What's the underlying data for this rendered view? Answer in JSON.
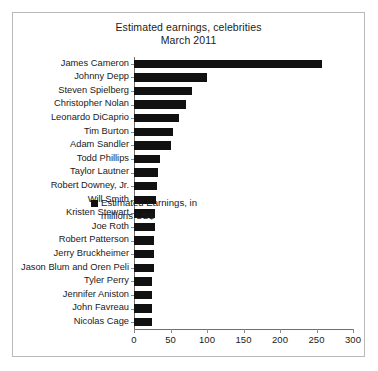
{
  "figure": {
    "title_line_1": "Estimated earnings, celebrities",
    "title_line_2": "March 2011",
    "border_color": "#b9b9b9",
    "background_color": "#ffffff",
    "bar_color": "#111111"
  },
  "legend": {
    "position": "inside-right",
    "entries": [
      {
        "label_line_1": "Estimated Earnings, in",
        "label_line_2": "millions US$",
        "color": "#111111"
      }
    ]
  },
  "chart_data": {
    "type": "bar",
    "orientation": "horizontal",
    "title": "Estimated earnings, celebrities\nMarch 2011",
    "xlabel": "",
    "ylabel": "",
    "xlim": [
      0,
      300
    ],
    "xticks": [
      0,
      50,
      100,
      150,
      200,
      250,
      300
    ],
    "xtick_labels": [
      "0",
      "50",
      "100",
      "150",
      "200",
      "250",
      "300"
    ],
    "grid": false,
    "legend_position": "center-right",
    "series": [
      {
        "name": "Estimated Earnings, in millions US$",
        "color": "#111111",
        "values": [
          257,
          100,
          80,
          71,
          62,
          53,
          50,
          35,
          33,
          32,
          30,
          29,
          29,
          28,
          28,
          27,
          25,
          25,
          24,
          24
        ]
      }
    ],
    "categories": [
      "James Cameron",
      "Johnny Depp",
      "Steven Spielberg",
      "Christopher Nolan",
      "Leonardo DiCaprio",
      "Tim Burton",
      "Adam Sandler",
      "Todd Phillips",
      "Taylor Lautner",
      "Robert Downey, Jr.",
      "Will Smith",
      "Kristen Stewart",
      "Joe Roth",
      "Robert Patterson",
      "Jerry Bruckheimer",
      "Jason Blum and Oren Peli",
      "Tyler Perry",
      "Jennifer Aniston",
      "John Favreau",
      "Nicolas Cage"
    ]
  }
}
